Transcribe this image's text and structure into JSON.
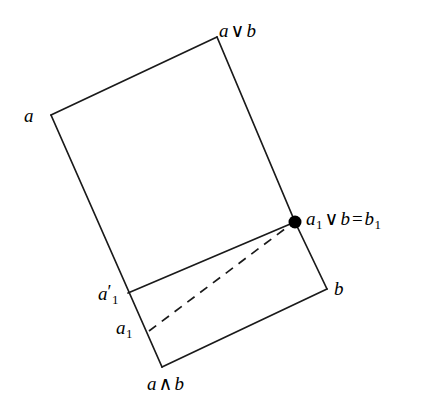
{
  "figure": {
    "type": "lattice-diagram",
    "background_color": "#ffffff",
    "stroke_color": "#1a1a1a",
    "width": 431,
    "height": 407
  },
  "labels": {
    "a": {
      "text": "a",
      "x": 24,
      "y": 106
    },
    "a_join_b": {
      "italic": "a",
      "op": "∨",
      "italic2": "b",
      "x": 219,
      "y": 21
    },
    "a1_join_b_eq_b1": {
      "var1": "a",
      "sub1": "1",
      "op1": "∨",
      "var2": "b",
      "op2": "=",
      "var3": "b",
      "sub3": "1",
      "x": 306,
      "y": 209
    },
    "b": {
      "text": "b",
      "x": 334,
      "y": 279
    },
    "a1_prime": {
      "var": "a",
      "prime": "′",
      "sub": "1",
      "x": 98,
      "y": 283
    },
    "a1": {
      "var": "a",
      "sub": "1",
      "x": 116,
      "y": 318
    },
    "a_meet_b": {
      "italic": "a",
      "op": "∧",
      "italic2": "b",
      "x": 147,
      "y": 374
    }
  },
  "vertices": [
    {
      "name": "a",
      "x": 51,
      "y": 115,
      "marked": false
    },
    {
      "name": "a-join-b",
      "x": 217,
      "y": 37,
      "marked": false
    },
    {
      "name": "a1-join-b-eq-b1",
      "x": 295,
      "y": 222,
      "marked": true
    },
    {
      "name": "b",
      "x": 327,
      "y": 289,
      "marked": false
    },
    {
      "name": "a-meet-b",
      "x": 162,
      "y": 367,
      "marked": false
    },
    {
      "name": "a1-prime",
      "x": 128,
      "y": 293,
      "marked": false
    },
    {
      "name": "a1",
      "x": 151,
      "y": 329,
      "marked": false
    }
  ],
  "edges": [
    {
      "name": "edge-a-to-a-join-b",
      "from": [
        51,
        115
      ],
      "to": [
        217,
        37
      ],
      "style": "solid"
    },
    {
      "name": "edge-a-join-b-to-b1",
      "from": [
        217,
        37
      ],
      "to": [
        295,
        222
      ],
      "style": "solid"
    },
    {
      "name": "edge-b1-to-b",
      "from": [
        295,
        222
      ],
      "to": [
        327,
        289
      ],
      "style": "solid"
    },
    {
      "name": "edge-b-to-a-meet-b",
      "from": [
        327,
        289
      ],
      "to": [
        162,
        367
      ],
      "style": "solid"
    },
    {
      "name": "edge-a-meet-b-to-a",
      "from": [
        162,
        367
      ],
      "to": [
        51,
        115
      ],
      "style": "solid"
    },
    {
      "name": "edge-a1-prime-to-b1",
      "from": [
        128,
        293
      ],
      "to": [
        295,
        222
      ],
      "style": "solid"
    },
    {
      "name": "edge-a1-to-b1-dashed",
      "from": [
        149,
        331
      ],
      "to": [
        290,
        225
      ],
      "style": "dashed"
    }
  ],
  "marker": {
    "name": "join-point-dot",
    "x": 295,
    "y": 222,
    "radius": 6.5,
    "fill": "#000000"
  },
  "style": {
    "stroke_width": 1.7,
    "dash_pattern": "9 7"
  }
}
